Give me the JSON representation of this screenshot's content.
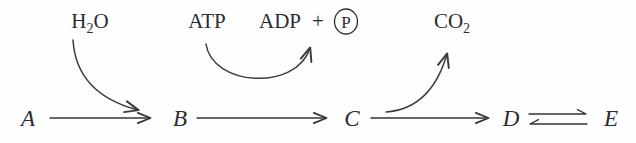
{
  "figure": {
    "type": "biochemical-pathway",
    "background_color": "#fefefe",
    "ink_color": "#2b2b33"
  },
  "metabolites": [
    {
      "id": "A",
      "label": "A",
      "x": 22
    },
    {
      "id": "B",
      "label": "B",
      "x": 176
    },
    {
      "id": "C",
      "label": "C",
      "x": 348
    },
    {
      "id": "D",
      "label": "D",
      "x": 508
    },
    {
      "id": "E",
      "label": "E",
      "x": 610
    }
  ],
  "cofactors": {
    "water": {
      "formula": "H",
      "subscript": "2",
      "suffix": "O",
      "x": 90,
      "y": 28
    },
    "atp": {
      "label": "ATP",
      "x": 207,
      "y": 28
    },
    "adp": {
      "label": "ADP",
      "x": 280,
      "y": 28
    },
    "plus": {
      "label": "+",
      "x": 318,
      "y": 28
    },
    "phosphate": {
      "label": "P",
      "x": 346,
      "y": 22,
      "radius": 11
    },
    "carbon_dioxide": {
      "formula": "CO",
      "subscript": "2",
      "x": 452,
      "y": 28
    }
  },
  "reactions": [
    {
      "from": "A",
      "to": "B",
      "arrow": "single",
      "reversible": false
    },
    {
      "from": "B",
      "to": "C",
      "arrow": "single",
      "reversible": false
    },
    {
      "from": "C",
      "to": "D",
      "arrow": "single",
      "reversible": false
    },
    {
      "from": "D",
      "to": "E",
      "arrow": "equilibrium",
      "reversible": true
    }
  ],
  "curved_arrows": [
    {
      "name": "water-input",
      "substrate": "H2O",
      "direction": "into-pathway",
      "target_step": "A-to-B"
    },
    {
      "name": "atp-to-adp",
      "substrate": "ATP",
      "product": "ADP + P",
      "direction": "coupled-u-arc",
      "target_step": "B-to-C"
    },
    {
      "name": "co2-output",
      "product": "CO2",
      "direction": "out-of-pathway",
      "target_step": "C-to-D"
    }
  ]
}
